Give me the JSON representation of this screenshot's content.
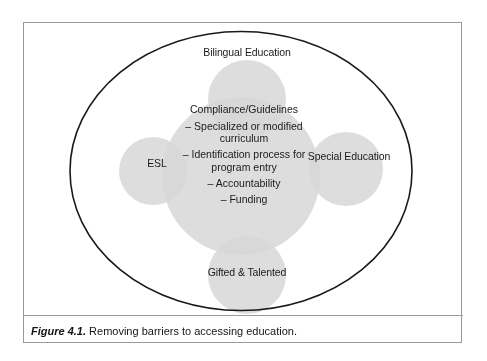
{
  "figure": {
    "caption_number": "Figure 4.1.",
    "caption_text": " Removing barriers to accessing education."
  },
  "diagram": {
    "type": "venn",
    "outer_boundary": {
      "shape": "ellipse",
      "stroke_color": "#1a1a1a"
    },
    "center_node": {
      "name": "compliance-guidelines",
      "heading": "Compliance/Guidelines",
      "items": [
        "– Specialized or modified curriculum",
        "– Identification process for program entry",
        "– Accountability",
        "– Funding"
      ],
      "fill_color": "#d8d8d8"
    },
    "satellite_nodes": [
      {
        "name": "bilingual-education",
        "label": "Bilingual Education",
        "position": "top",
        "fill_color": "#d8d8d8"
      },
      {
        "name": "special-education",
        "label": "Special Education",
        "position": "right",
        "fill_color": "#d8d8d8"
      },
      {
        "name": "gifted-and-talented",
        "label": "Gifted & Talented",
        "position": "bottom",
        "fill_color": "#d8d8d8"
      },
      {
        "name": "esl",
        "label": "ESL",
        "position": "left",
        "fill_color": "#d8d8d8"
      }
    ],
    "colors": {
      "circle_fill": "#d8d8d8",
      "overlap_fill": "#b8b8b8",
      "frame_border": "#9a9a9a",
      "text": "#1a1a1a",
      "background": "#ffffff"
    }
  }
}
